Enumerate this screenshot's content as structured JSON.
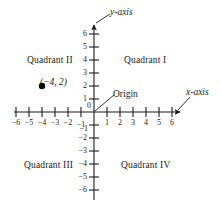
{
  "figure": {
    "kind": "cartesian-coordinate-plane",
    "background_color": "#ffffff",
    "ink_color": "#1a1a1a"
  },
  "axis_labels": {
    "y": "y-axis",
    "x": "x-axis",
    "origin": "Origin"
  },
  "quadrants": {
    "q1": "Quadrant I",
    "q2": "Quadrant II",
    "q3": "Quadrant III",
    "q4": "Quadrant IV"
  },
  "point": {
    "label": "(−4, 2)",
    "x": -4,
    "y": 2,
    "marker": "filled-circle",
    "color": "#000000"
  },
  "chart_data": {
    "type": "scatter",
    "title": "",
    "xlabel": "x-axis",
    "ylabel": "y-axis",
    "xlim": [
      -7,
      7
    ],
    "ylim": [
      -7,
      7
    ],
    "grid": false,
    "legend": null,
    "x_ticks": [
      -6,
      -5,
      -4,
      -3,
      -2,
      -1,
      1,
      2,
      3,
      4,
      5,
      6
    ],
    "y_ticks": [
      -6,
      -5,
      -4,
      -3,
      -2,
      -1,
      1,
      2,
      3,
      4,
      5,
      6
    ],
    "x_tick_labels": [
      "−6",
      "−5",
      "−4",
      "−3",
      "−2",
      "−1",
      "1",
      "2",
      "3",
      "4",
      "5",
      "6"
    ],
    "y_tick_labels": [
      "−6",
      "−5",
      "−4",
      "−3",
      "−2",
      "−1",
      "1",
      "2",
      "3",
      "4",
      "5",
      "6"
    ],
    "origin_label": "0",
    "points": [
      {
        "x": -4,
        "y": 2,
        "label": "(−4, 2)"
      }
    ],
    "annotations": [
      {
        "text": "Quadrant I",
        "x": 3.5,
        "y": 4
      },
      {
        "text": "Quadrant II",
        "x": -3.5,
        "y": 4
      },
      {
        "text": "Quadrant III",
        "x": -3.5,
        "y": -4
      },
      {
        "text": "Quadrant IV",
        "x": 3.5,
        "y": -4
      },
      {
        "text": "Origin",
        "x": 0,
        "y": 0
      },
      {
        "text": "y-axis",
        "x": 0,
        "y": 7
      },
      {
        "text": "x-axis",
        "x": 7,
        "y": 0
      }
    ]
  }
}
